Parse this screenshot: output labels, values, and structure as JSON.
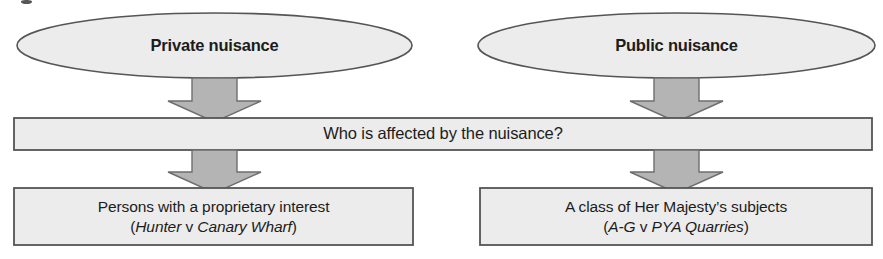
{
  "diagram": {
    "type": "flow-diagram",
    "background_color": "#ffffff",
    "shape_fill_color": "#ececec",
    "shape_stroke_color": "#555555",
    "arrow_fill_color": "#b4b4b4",
    "arrow_stroke_color": "#6e6e6e",
    "text_color": "#1c1c1c"
  },
  "nodes": {
    "ellipse_left": {
      "label": "Private nuisance",
      "shape": "ellipse"
    },
    "ellipse_right": {
      "label": "Public nuisance",
      "shape": "ellipse"
    },
    "question_bar": {
      "label": "Who is affected by the nuisance?",
      "shape": "rectangle"
    },
    "outcome_left": {
      "line1": "Persons with a proprietary interest",
      "citation_open": "(",
      "case_name_1": "Hunter",
      "citation_v": " v ",
      "case_name_2": "Canary Wharf",
      "citation_close": ")",
      "shape": "rectangle"
    },
    "outcome_right": {
      "line1": "A class of Her Majesty’s subjects",
      "citation_open": "(",
      "case_name_1": "A-G",
      "citation_v": " v ",
      "case_name_2": "PYA Quarries",
      "citation_close": ")",
      "shape": "rectangle"
    }
  },
  "connectors": [
    {
      "name": "arrow-private-to-question",
      "direction": "down",
      "style": "block-arrow"
    },
    {
      "name": "arrow-public-to-question",
      "direction": "down",
      "style": "block-arrow"
    },
    {
      "name": "arrow-question-to-outcome-left",
      "direction": "down",
      "style": "block-arrow"
    },
    {
      "name": "arrow-question-to-outcome-right",
      "direction": "down",
      "style": "block-arrow"
    }
  ]
}
